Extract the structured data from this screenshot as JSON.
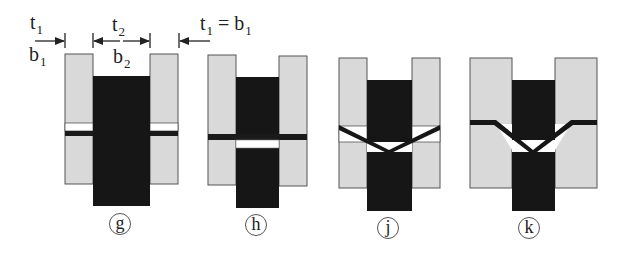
{
  "diagram": {
    "type": "joint-geometry schematic",
    "colors": {
      "plate": "#d9d9d9",
      "insert": "#161616",
      "outline": "#555555",
      "gap": "#ffffff"
    },
    "dimension_labels": {
      "t1_left": "t",
      "t1_left_sub": "1",
      "b1_left": "b",
      "b1_left_sub": "1",
      "t2": "t",
      "t2_sub": "2",
      "b2": "b",
      "b2_sub": "2",
      "t1_eq": "t",
      "t1_eq_sub": "1",
      "eq": " = ",
      "b1_eq": "b",
      "b1_eq_sub": "1"
    },
    "panels": [
      {
        "id": "g",
        "label": "g",
        "joint": "horizontal gap + dark bar on outer plates"
      },
      {
        "id": "h",
        "label": "h",
        "joint": "continuous dark bar, white gap in insert"
      },
      {
        "id": "j",
        "label": "j",
        "joint": "V-shaped bar"
      },
      {
        "id": "k",
        "label": "k",
        "joint": "V-shaped bar with flat shoulders"
      }
    ]
  }
}
